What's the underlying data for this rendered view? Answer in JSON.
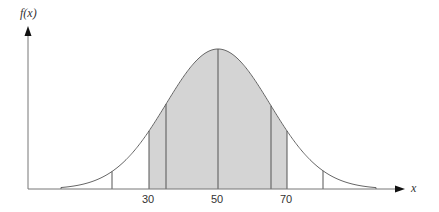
{
  "chart_data": {
    "type": "area",
    "title": "",
    "xlabel": "x",
    "ylabel": "f(x)",
    "x_tick_labels": [
      "30",
      "50",
      "70"
    ],
    "mean": 50,
    "shaded_region": [
      30,
      70
    ],
    "vertical_lines": [
      {
        "position": "left-tail-marker",
        "shaded": false
      },
      {
        "position": 30,
        "shaded": true
      },
      {
        "position": "inner-left",
        "shaded": true
      },
      {
        "position": 50,
        "shaded": true
      },
      {
        "position": "inner-right",
        "shaded": true
      },
      {
        "position": 70,
        "shaded": true
      },
      {
        "position": "right-tail-marker",
        "shaded": false
      }
    ],
    "grid": false,
    "legend": null
  },
  "axes": {
    "y_label": "f(x)",
    "x_label": "x",
    "ticks": [
      {
        "label": "30",
        "px": 149
      },
      {
        "label": "50",
        "px": 218
      },
      {
        "label": "70",
        "px": 287
      }
    ]
  },
  "colors": {
    "shade": "#d4d4d4",
    "line": "#555555",
    "axis": "#777777",
    "curve": "#666666"
  }
}
